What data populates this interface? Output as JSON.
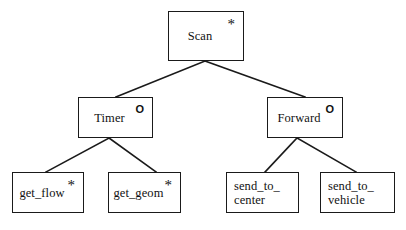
{
  "diagram": {
    "type": "hierarchy-tree",
    "title": "",
    "background_color": "#ffffff",
    "line_color": "#1a1a1a",
    "text_color": "#111111",
    "markers": {
      "star_glyph": "*",
      "circle_glyph": "O",
      "star_meaning_label": "*",
      "circle_meaning_label": "O"
    },
    "nodes": [
      {
        "id": "scan",
        "label": "Scan",
        "label_lines": [
          "Scan"
        ],
        "marker": "*",
        "level": 0,
        "x": 168,
        "y": 11,
        "w": 76,
        "h": 50
      },
      {
        "id": "timer",
        "label": "Timer",
        "label_lines": [
          "Timer"
        ],
        "marker": "O",
        "level": 1,
        "x": 78,
        "y": 97,
        "w": 75,
        "h": 41
      },
      {
        "id": "forward",
        "label": "Forward",
        "label_lines": [
          "Forward"
        ],
        "marker": "O",
        "level": 1,
        "x": 267,
        "y": 97,
        "w": 76,
        "h": 41
      },
      {
        "id": "get_flow",
        "label": "get_flow",
        "label_lines": [
          "get_flow"
        ],
        "marker": "*",
        "level": 2,
        "x": 12,
        "y": 172,
        "w": 72,
        "h": 41
      },
      {
        "id": "get_geom",
        "label": "get_geom",
        "label_lines": [
          "get_geom"
        ],
        "marker": "*",
        "level": 2,
        "x": 108,
        "y": 172,
        "w": 73,
        "h": 41
      },
      {
        "id": "send_to_center",
        "label": "send_to_ center",
        "label_lines": [
          "send_to_",
          "center"
        ],
        "marker": "",
        "level": 2,
        "x": 226,
        "y": 172,
        "w": 73,
        "h": 41
      },
      {
        "id": "send_to_vehicle",
        "label": "send_to_ vehicle",
        "label_lines": [
          "send_to_",
          "vehicle"
        ],
        "marker": "",
        "level": 2,
        "x": 320,
        "y": 172,
        "w": 75,
        "h": 41
      }
    ],
    "edges": [
      {
        "id": "scan-timer",
        "from": "scan",
        "to": "timer",
        "x1": 205,
        "y1": 61,
        "x2": 116,
        "y2": 97
      },
      {
        "id": "scan-forward",
        "from": "scan",
        "to": "forward",
        "x1": 205,
        "y1": 61,
        "x2": 305,
        "y2": 97
      },
      {
        "id": "timer-get_flow",
        "from": "timer",
        "to": "get_flow",
        "x1": 109,
        "y1": 138,
        "x2": 46,
        "y2": 172
      },
      {
        "id": "timer-get_geom",
        "from": "timer",
        "to": "get_geom",
        "x1": 109,
        "y1": 138,
        "x2": 156,
        "y2": 172
      },
      {
        "id": "forward-send_to_center",
        "from": "forward",
        "to": "send_to_center",
        "x1": 297,
        "y1": 138,
        "x2": 265,
        "y2": 172
      },
      {
        "id": "forward-send_to_vehicle",
        "from": "forward",
        "to": "send_to_vehicle",
        "x1": 297,
        "y1": 138,
        "x2": 356,
        "y2": 172
      }
    ]
  }
}
